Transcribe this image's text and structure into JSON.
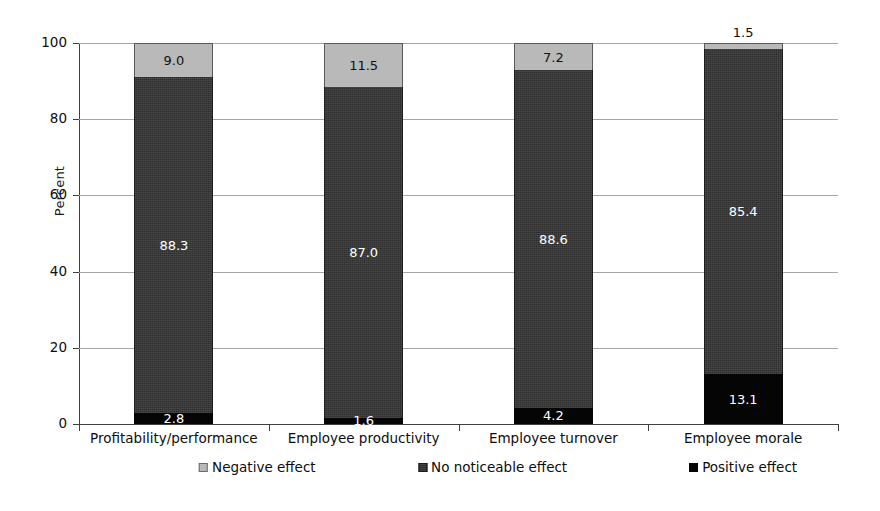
{
  "chart_data": {
    "type": "bar",
    "subtype": "stacked-100-percent",
    "title": "",
    "xlabel": "",
    "ylabel": "Percent",
    "ylim": [
      0,
      100
    ],
    "yticks": [
      0,
      20,
      40,
      60,
      80,
      100
    ],
    "grid": true,
    "legend_position": "bottom",
    "categories": [
      "Profitability/performance",
      "Employee productivity",
      "Employee turnover",
      "Employee morale"
    ],
    "series": [
      {
        "name": "Negative effect",
        "color": "#b9b9b9",
        "values": [
          9.0,
          11.5,
          7.2,
          1.5
        ],
        "labels": [
          "9.0",
          "11.5",
          "7.2",
          "1.5"
        ],
        "label_outside": [
          false,
          false,
          false,
          true
        ]
      },
      {
        "name": "No noticeable effect",
        "color": "#2e2e2e",
        "values": [
          88.3,
          87.0,
          88.6,
          85.4
        ],
        "labels": [
          "88.3",
          "87.0",
          "88.6",
          "85.4"
        ],
        "label_outside": [
          false,
          false,
          false,
          false
        ]
      },
      {
        "name": "Positive effect",
        "color": "#050505",
        "values": [
          2.8,
          1.6,
          4.2,
          13.1
        ],
        "labels": [
          "2.8",
          "1.6",
          "4.2",
          "13.1"
        ],
        "label_outside": [
          false,
          false,
          false,
          false
        ]
      }
    ]
  },
  "axis": {
    "y_title": "Percent",
    "y_tick_labels": [
      "100",
      "80",
      "60",
      "40",
      "20",
      "0"
    ]
  },
  "legend": {
    "items": [
      {
        "label": "Negative effect",
        "swatch": "swatch-light-gray"
      },
      {
        "label": "No noticeable effect",
        "swatch": "swatch-dark-textured"
      },
      {
        "label": "Positive effect",
        "swatch": "swatch-black"
      }
    ]
  }
}
